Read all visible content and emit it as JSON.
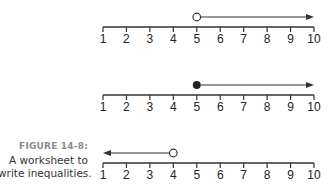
{
  "figure": {
    "label": "FIGURE 14-8:",
    "caption_line1": "A worksheet to",
    "caption_line2": "write inequalities."
  },
  "colors": {
    "line": "#333333",
    "text": "#222222",
    "caption_label": "#8a8a8a"
  },
  "number_lines": [
    {
      "id": "line-1",
      "ticks": [
        "1",
        "2",
        "3",
        "4",
        "5",
        "6",
        "7",
        "8",
        "9",
        "10"
      ],
      "point": 5,
      "point_style": "open",
      "direction": "right",
      "arrow_end": 10
    },
    {
      "id": "line-2",
      "ticks": [
        "1",
        "2",
        "3",
        "4",
        "5",
        "6",
        "7",
        "8",
        "9",
        "10"
      ],
      "point": 5,
      "point_style": "closed",
      "direction": "right",
      "arrow_end": 10
    },
    {
      "id": "line-3",
      "ticks": [
        "1",
        "2",
        "3",
        "4",
        "5",
        "6",
        "7",
        "8",
        "9",
        "10"
      ],
      "point": 4,
      "point_style": "open",
      "direction": "left",
      "arrow_end": 1
    }
  ]
}
